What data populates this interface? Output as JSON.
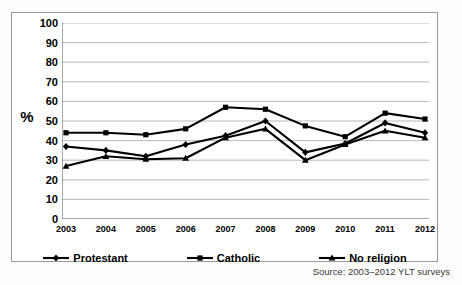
{
  "figure": {
    "y_axis_title": "%",
    "source_note": "Source: 2003–2012 YLT surveys"
  },
  "legend": {
    "items": [
      {
        "label": "Protestant",
        "marker": "diamond-marker-icon",
        "color": "#000000"
      },
      {
        "label": "Catholic",
        "marker": "square-marker-icon",
        "color": "#000000"
      },
      {
        "label": "No religion",
        "marker": "triangle-marker-icon",
        "color": "#000000"
      }
    ]
  },
  "chart_data": {
    "type": "line",
    "title": "",
    "xlabel": "",
    "ylabel": "%",
    "x": [
      "2003",
      "2004",
      "2005",
      "2006",
      "2007",
      "2008",
      "2009",
      "2010",
      "2011",
      "2012"
    ],
    "categories": [
      "2003",
      "2004",
      "2005",
      "2006",
      "2007",
      "2008",
      "2009",
      "2010",
      "2011",
      "2012"
    ],
    "ylim": [
      0,
      100
    ],
    "ytick_labels": [
      "0",
      "10",
      "20",
      "30",
      "40",
      "50",
      "60",
      "70",
      "80",
      "90",
      "100"
    ],
    "ytick_values": [
      0,
      10,
      20,
      30,
      40,
      50,
      60,
      70,
      80,
      90,
      100
    ],
    "grid": "horizontal",
    "legend_position": "bottom",
    "series": [
      {
        "name": "Protestant",
        "marker": "diamond",
        "color": "#000000",
        "values": [
          37,
          35,
          32,
          38,
          42.5,
          50,
          34,
          38.5,
          49,
          44
        ]
      },
      {
        "name": "Catholic",
        "marker": "square",
        "color": "#000000",
        "values": [
          44,
          44,
          43,
          46,
          57,
          56,
          47.5,
          42,
          54,
          51
        ]
      },
      {
        "name": "No religion",
        "marker": "triangle",
        "color": "#000000",
        "values": [
          27,
          32,
          30.5,
          31,
          41.5,
          46,
          30,
          38,
          45,
          41.5
        ]
      }
    ]
  }
}
